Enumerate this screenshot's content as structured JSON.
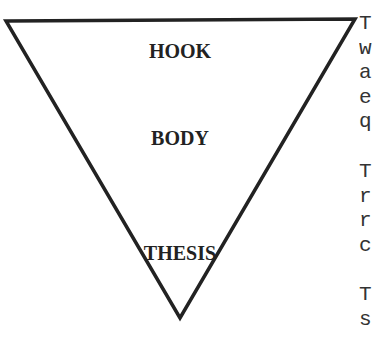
{
  "diagram": {
    "shape": "inverted-triangle",
    "stroke_color": "#222222",
    "labels": {
      "top": "HOOK",
      "middle": "BODY",
      "bottom": "THESIS"
    }
  },
  "side_text": {
    "paragraph1": [
      "T",
      "w",
      "a",
      "e",
      "q"
    ],
    "paragraph2": [
      "T",
      "r",
      "r",
      "c"
    ],
    "paragraph3": [
      "T",
      "s"
    ]
  }
}
